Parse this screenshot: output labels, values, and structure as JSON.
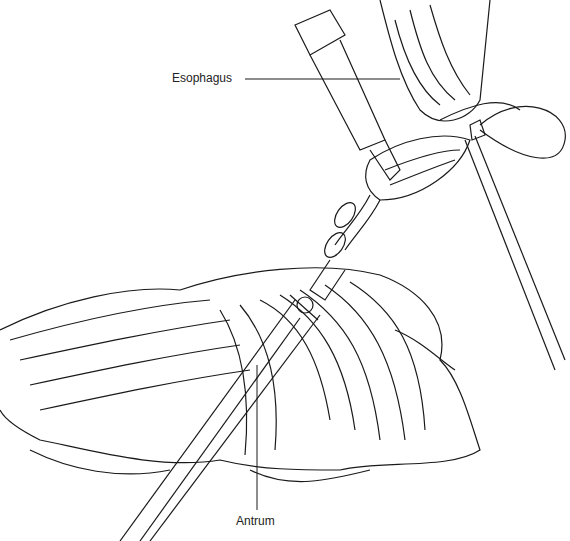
{
  "figure": {
    "labels": {
      "esophagus": "Esophagus",
      "antrum": "Antrum"
    },
    "colors": {
      "line": "#1a1a1a",
      "background": "#ffffff"
    }
  }
}
